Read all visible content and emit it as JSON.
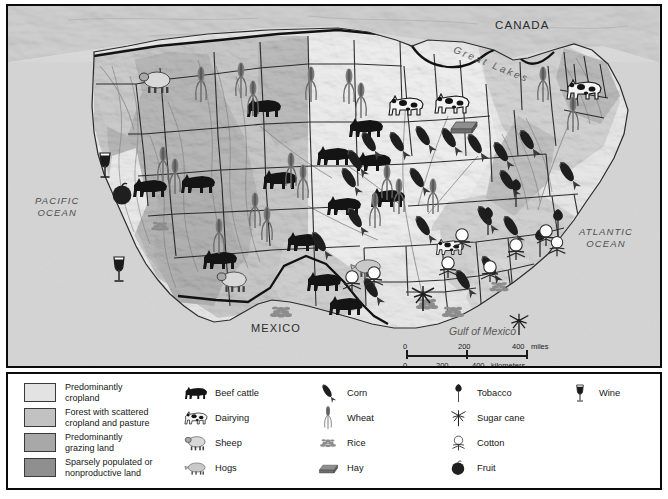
{
  "map": {
    "title_labels": [
      {
        "name": "canada-label",
        "text": "CANADA",
        "x": 487,
        "y": 14,
        "size": 11.5,
        "style": "cap"
      },
      {
        "name": "great-lakes-label",
        "text": "Great Lakes",
        "x": 452,
        "y": 40,
        "size": 10,
        "style": "ital"
      },
      {
        "name": "mexico-label",
        "text": "MEXICO",
        "x": 243,
        "y": 318,
        "size": 11,
        "style": "cap"
      },
      {
        "name": "gulf-of-mexico-label",
        "text": "Gulf of Mexico",
        "x": 441,
        "y": 321,
        "size": 10.5,
        "style": "ital"
      },
      {
        "name": "pacific-ocean-label",
        "text": "PACIFIC\nOCEAN",
        "x": 27,
        "y": 191,
        "size": 9.5,
        "style": "ital cap"
      },
      {
        "name": "atlantic-ocean-label",
        "text": "ATLANTIC\nOCEAN",
        "x": 576,
        "y": 222,
        "size": 9.5,
        "style": "ital cap"
      }
    ],
    "scale": {
      "miles_values": [
        "0",
        "200",
        "400"
      ],
      "miles_unit": "miles",
      "km_values": [
        "0",
        "200",
        "400"
      ],
      "km_unit": "kilometers"
    }
  },
  "legend": {
    "land_use": [
      {
        "label": "Predominantly\ncropland",
        "color": "#e3e3e3"
      },
      {
        "label": "Forest with scattered\ncropland and pasture",
        "color": "#c2c2c2"
      },
      {
        "label": "Predominantly\ngrazing land",
        "color": "#a8a8a8"
      },
      {
        "label": "Sparsely populated or\nnonproductive land",
        "color": "#8f8f8f"
      }
    ],
    "livestock": [
      {
        "label": "Beef cattle",
        "icon": "beef-cattle-icon"
      },
      {
        "label": "Dairying",
        "icon": "dairying-icon"
      },
      {
        "label": "Sheep",
        "icon": "sheep-icon"
      },
      {
        "label": "Hogs",
        "icon": "hogs-icon"
      }
    ],
    "grains": [
      {
        "label": "Corn",
        "icon": "corn-icon"
      },
      {
        "label": "Wheat",
        "icon": "wheat-icon"
      },
      {
        "label": "Rice",
        "icon": "rice-icon"
      },
      {
        "label": "Hay",
        "icon": "hay-icon"
      }
    ],
    "crops": [
      {
        "label": "Tobacco",
        "icon": "tobacco-icon"
      },
      {
        "label": "Sugar cane",
        "icon": "sugar-cane-icon"
      },
      {
        "label": "Cotton",
        "icon": "cotton-icon"
      },
      {
        "label": "Fruit",
        "icon": "fruit-icon"
      }
    ],
    "beverages": [
      {
        "label": "Wine",
        "icon": "wine-icon"
      }
    ]
  },
  "colors": {
    "frame": "#0a0a0a",
    "ocean": "#d4d4d4",
    "cropland": "#e3e3e3",
    "forest": "#c2c2c2",
    "grazing": "#a8a8a8",
    "sparse": "#8f8f8f",
    "boundary": "#1c1c1c",
    "icon_dark": "#1a1a1a"
  }
}
